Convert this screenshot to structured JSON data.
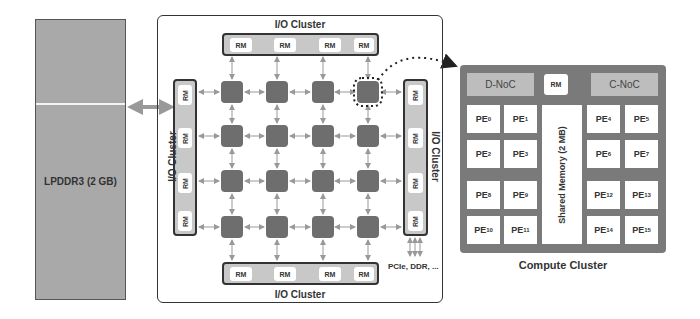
{
  "lpddr": {
    "label": "LPDDR3 (2 GB)"
  },
  "soc": {
    "io_top_label": "I/O Cluster",
    "io_bottom_label": "I/O Cluster",
    "io_left_label": "I/O Cluster",
    "io_right_label": "I/O Cluster",
    "top_rms": [
      "RM",
      "RM",
      "RM",
      "RM"
    ],
    "bottom_rms": [
      "RM",
      "RM",
      "RM",
      "RM"
    ],
    "left_rms": [
      "RM",
      "RM",
      "RM",
      "RM"
    ],
    "right_rms": [
      "RM",
      "RM",
      "RM",
      "RM"
    ],
    "router_grid": {
      "rows": 4,
      "cols": 4
    },
    "external_io_label": "PCIe, DDR, ..."
  },
  "compute_cluster": {
    "label": "Compute Cluster",
    "d_noc": "D-NoC",
    "c_noc": "C-NoC",
    "rm": "RM",
    "shared_memory": "Shared Memory (2 MB)",
    "pes_left": [
      {
        "base": "PE",
        "idx": "0"
      },
      {
        "base": "PE",
        "idx": "1"
      },
      {
        "base": "PE",
        "idx": "2"
      },
      {
        "base": "PE",
        "idx": "3"
      },
      {
        "base": "PE",
        "idx": "8"
      },
      {
        "base": "PE",
        "idx": "9"
      },
      {
        "base": "PE",
        "idx": "10"
      },
      {
        "base": "PE",
        "idx": "11"
      }
    ],
    "pes_right": [
      {
        "base": "PE",
        "idx": "4"
      },
      {
        "base": "PE",
        "idx": "5"
      },
      {
        "base": "PE",
        "idx": "6"
      },
      {
        "base": "PE",
        "idx": "7"
      },
      {
        "base": "PE",
        "idx": "12"
      },
      {
        "base": "PE",
        "idx": "13"
      },
      {
        "base": "PE",
        "idx": "14"
      },
      {
        "base": "PE",
        "idx": "15"
      }
    ]
  },
  "colors": {
    "memory_fill": "#a9a9a9",
    "router_fill": "#6e6e6e",
    "rm_bar_fill": "#c8c8c8",
    "compute_fill": "#7a7a7a",
    "noc_fill": "#bdbdbd",
    "arrow": "#999999"
  }
}
